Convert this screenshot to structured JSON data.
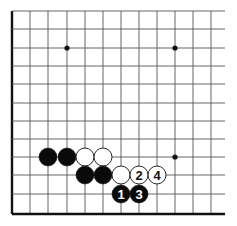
{
  "diagram": {
    "type": "go-board-corner",
    "grid": {
      "x_lines": [
        12,
        30,
        48,
        67,
        85,
        103,
        121,
        139,
        157,
        175,
        193,
        211
      ],
      "y_lines": [
        11,
        29,
        48,
        66,
        84,
        103,
        121,
        139,
        157,
        175,
        194,
        214
      ],
      "edge_left_x": 12,
      "edge_bottom_y": 214,
      "right_extent_x": 225,
      "top_extent_y": 11,
      "line_color": "#555555",
      "edge_color": "#111111"
    },
    "star_points": [
      {
        "x": 67,
        "y": 48
      },
      {
        "x": 175,
        "y": 48
      },
      {
        "x": 175,
        "y": 157
      }
    ],
    "stones": [
      {
        "color": "black",
        "x": 48,
        "y": 157,
        "label": ""
      },
      {
        "color": "black",
        "x": 67,
        "y": 157,
        "label": ""
      },
      {
        "color": "white",
        "x": 85,
        "y": 157,
        "label": ""
      },
      {
        "color": "white",
        "x": 103,
        "y": 157,
        "label": ""
      },
      {
        "color": "black",
        "x": 85,
        "y": 175,
        "label": ""
      },
      {
        "color": "black",
        "x": 103,
        "y": 175,
        "label": ""
      },
      {
        "color": "white",
        "x": 121,
        "y": 175,
        "label": ""
      },
      {
        "color": "white",
        "x": 139,
        "y": 175,
        "label": "2"
      },
      {
        "color": "white",
        "x": 157,
        "y": 175,
        "label": "4"
      },
      {
        "color": "black",
        "x": 121,
        "y": 194,
        "label": "1"
      },
      {
        "color": "black",
        "x": 139,
        "y": 194,
        "label": "3"
      }
    ],
    "stone_radius": 9
  }
}
